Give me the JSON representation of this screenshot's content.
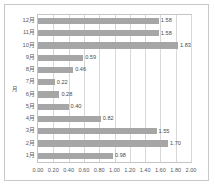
{
  "figure": {
    "caption_clipped": ""
  },
  "chart_data": {
    "type": "bar",
    "orientation": "horizontal",
    "title": "",
    "xlabel": "",
    "ylabel": "月",
    "categories": [
      "1月",
      "2月",
      "3月",
      "4月",
      "5月",
      "6月",
      "7月",
      "8月",
      "9月",
      "10月",
      "11月",
      "12月"
    ],
    "values": [
      0.98,
      1.7,
      1.55,
      0.82,
      0.4,
      0.28,
      0.22,
      0.46,
      0.59,
      1.83,
      1.58,
      1.58
    ],
    "data_labels": [
      "0.98",
      "1.70",
      "1.55",
      "0.82",
      "0.40",
      "0.28",
      "0.22",
      "0.46",
      "0.59",
      "1.83",
      "1.58",
      "1.58"
    ],
    "display_order_top_to_bottom": [
      "12月",
      "11月",
      "10月",
      "9月",
      "8月",
      "7月",
      "6月",
      "5月",
      "4月",
      "3月",
      "2月",
      "1月"
    ],
    "xlim": [
      0.0,
      2.0
    ],
    "xticks": [
      0.0,
      0.2,
      0.4,
      0.6,
      0.8,
      1.0,
      1.2,
      1.4,
      1.6,
      1.8,
      2.0
    ],
    "xtick_labels": [
      "0.00",
      "0.20",
      "0.40",
      "0.60",
      "0.80",
      "1.00",
      "1.20",
      "1.40",
      "1.60",
      "1.80",
      "2.00"
    ],
    "grid": "vertical",
    "legend": "none",
    "bar_color": "#a6a6a6",
    "grid_color": "#d8d8d8",
    "axis_color": "#c4c4c4",
    "text_color": "#5a5a5a"
  }
}
